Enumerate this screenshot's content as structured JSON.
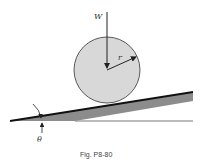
{
  "figure": {
    "caption": "Fig. P8-80",
    "labels": {
      "weight": "W",
      "radius": "r",
      "angle": "θ"
    },
    "colors": {
      "disk_fill": "#d8d8d8",
      "incline_fill": "#8c8c8c",
      "stroke": "#222222"
    }
  }
}
